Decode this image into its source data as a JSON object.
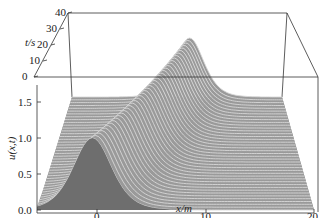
{
  "chart_data": {
    "type": "surface3d",
    "title": "",
    "axes": {
      "x": {
        "label": "x/m",
        "range": [
          -5,
          20
        ],
        "ticks": [
          "0",
          "10",
          "20"
        ]
      },
      "t": {
        "label": "t/s",
        "range": [
          0,
          40
        ],
        "ticks": [
          "0",
          "10",
          "20",
          "30",
          "40"
        ]
      },
      "u": {
        "label": "u(x,t)",
        "range": [
          0,
          1.7
        ],
        "ticks": [
          "0.0",
          "0.5",
          "1.0",
          "1.5"
        ]
      }
    },
    "series": [
      {
        "name": "u(x,t)",
        "peak_amplitude": 1.0,
        "peak_x_at_t0": 0,
        "peak_x_at_t40": 9,
        "speed_m_per_s": 0.225,
        "pulse_half_width_m": 2.5
      }
    ],
    "grid": false,
    "legend": null,
    "colors": {
      "surface": "#9a9a9a",
      "surface_highlight": "#d8d8d8",
      "floor": "#8c8c8c",
      "front_face": "#6e6e6e",
      "box_lines": "#333333"
    }
  },
  "labels": {
    "t_axis": "t/s",
    "u_axis": "u(x,t)",
    "x_axis": "x/m",
    "t_ticks": [
      "0",
      "10",
      "20",
      "30",
      "40"
    ],
    "u_ticks": [
      "0.0",
      "0.5",
      "1.0",
      "1.5"
    ],
    "x_ticks": [
      "0",
      "10",
      "20"
    ]
  }
}
